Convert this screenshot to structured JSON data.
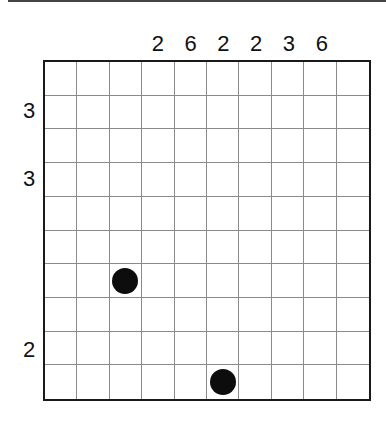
{
  "puzzle": {
    "rows": 10,
    "cols": 10,
    "column_clues": [
      "",
      "",
      "",
      "2",
      "6",
      "2",
      "2",
      "3",
      "6",
      ""
    ],
    "row_clues": [
      "",
      "3",
      "",
      "3",
      "",
      "",
      "",
      "",
      "2",
      ""
    ],
    "filled_cells": [
      {
        "row": 6,
        "col": 2
      },
      {
        "row": 9,
        "col": 5
      }
    ]
  },
  "colors": {
    "grid_border": "#1a1a1a",
    "grid_line": "#8a8a8a",
    "dot": "#0d0d0d",
    "background": "#ffffff"
  }
}
